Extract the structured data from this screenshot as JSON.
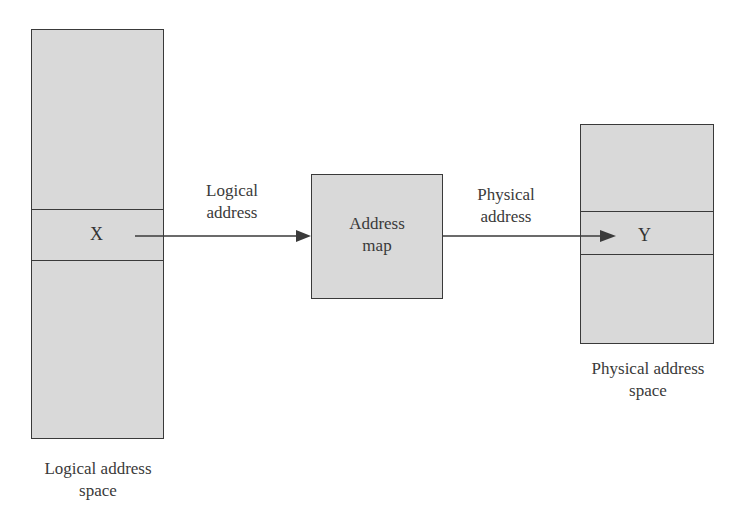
{
  "diagram": {
    "logical_space": {
      "label": "Logical address space",
      "label_line1": "Logical address",
      "label_line2": "space",
      "entry": "X"
    },
    "address_map": {
      "label_line1": "Address",
      "label_line2": "map"
    },
    "physical_space": {
      "label_line1": "Physical address",
      "label_line2": "space",
      "entry": "Y"
    },
    "arrows": [
      {
        "from": "X",
        "to": "Address map",
        "label_line1": "Logical",
        "label_line2": "address"
      },
      {
        "from": "Address map",
        "to": "Y",
        "label_line1": "Physical",
        "label_line2": "address"
      }
    ],
    "colors": {
      "box_fill": "#d9d9d9",
      "stroke": "#3a3a3a",
      "text": "#3a3a3a"
    }
  }
}
